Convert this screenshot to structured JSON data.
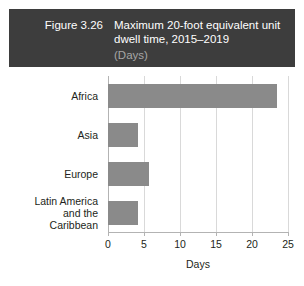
{
  "header": {
    "figure_number": "Figure 3.26",
    "title": "Maximum 20-foot equivalent unit dwell time, 2015–2019",
    "unit": "(Days)",
    "background_color": "#3d3d3d",
    "title_color": "#ffffff",
    "unit_color": "#a6a6a6"
  },
  "chart_data": {
    "type": "bar",
    "orientation": "horizontal",
    "title": "Maximum 20-foot equivalent unit dwell time, 2015–2019",
    "subtitle": "(Days)",
    "categories": [
      "Africa",
      "Asia",
      "Europe",
      "Latin America\nand the\nCaribbean"
    ],
    "values": [
      23.5,
      4.1,
      5.7,
      4.2
    ],
    "xlabel": "Days",
    "ylabel": "",
    "xlim": [
      0,
      25
    ],
    "xticks": [
      0,
      5,
      10,
      15,
      20,
      25
    ],
    "xtick_labels": [
      "0",
      "5",
      "10",
      "15",
      "20",
      "25"
    ],
    "grid": true,
    "grid_axis": "x",
    "legend": false,
    "bar_color": "#8a8a8a",
    "gridline_color": "#d9d9d9",
    "axis_color": "#b3b3b3"
  }
}
